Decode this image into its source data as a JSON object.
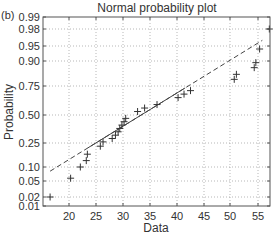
{
  "panel_label": "(b)",
  "chart_data": {
    "type": "scatter",
    "title": "Normal probability plot",
    "xlabel": "Data",
    "ylabel": "Probability",
    "xlim": [
      15.5,
      57.5
    ],
    "xticks": [
      20,
      25,
      30,
      35,
      40,
      45,
      50,
      55
    ],
    "yticks": [
      0.01,
      0.02,
      0.05,
      0.1,
      0.25,
      0.5,
      0.75,
      0.9,
      0.95,
      0.98,
      0.99
    ],
    "ytick_labels": [
      "0.01",
      "0.02",
      "0.05",
      "0.10",
      "0.25",
      "0.50",
      "0.75",
      "0.90",
      "0.95",
      "0.98",
      "0.99"
    ],
    "ytick_px": [
      206,
      197,
      181,
      167,
      143,
      115,
      86,
      61,
      46,
      29,
      17
    ],
    "xtick_px": [
      69,
      96,
      123,
      150,
      177,
      204,
      230,
      258
    ],
    "grid": true,
    "marker": "+",
    "series": [
      {
        "name": "data",
        "points": [
          [
            16.5,
            0.02
          ],
          [
            20.3,
            0.06
          ],
          [
            22.1,
            0.1
          ],
          [
            23.2,
            0.14
          ],
          [
            23.4,
            0.18
          ],
          [
            25.8,
            0.23
          ],
          [
            26.3,
            0.26
          ],
          [
            28.0,
            0.29
          ],
          [
            28.6,
            0.32
          ],
          [
            29.1,
            0.35
          ],
          [
            29.4,
            0.38
          ],
          [
            29.8,
            0.41
          ],
          [
            30.2,
            0.44
          ],
          [
            30.5,
            0.47
          ],
          [
            32.7,
            0.53
          ],
          [
            34.0,
            0.56
          ],
          [
            36.3,
            0.59
          ],
          [
            40.2,
            0.65
          ],
          [
            41.3,
            0.68
          ],
          [
            42.5,
            0.71
          ],
          [
            50.6,
            0.79
          ],
          [
            51.0,
            0.82
          ],
          [
            54.3,
            0.86
          ],
          [
            54.6,
            0.89
          ],
          [
            55.3,
            0.94
          ],
          [
            57.1,
            0.98
          ]
        ]
      }
    ],
    "reference_line": {
      "style": "solid between quartiles, dashed extension",
      "start": [
        16.5,
        0.085
      ],
      "end": [
        55.8,
        0.96
      ],
      "solid_from_x": 23.5,
      "solid_to_x": 41.5
    }
  }
}
